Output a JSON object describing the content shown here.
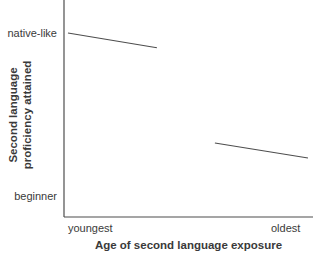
{
  "chart_data": {
    "type": "line",
    "title": "",
    "xlabel": "Age of second language exposure",
    "ylabel": "Second language proficiency attained",
    "x_tick_labels": [
      "youngest",
      "oldest"
    ],
    "y_tick_labels": [
      "native-like",
      "beginner"
    ],
    "x_range": [
      0,
      1
    ],
    "y_range": [
      0,
      1
    ],
    "grid": false,
    "legend": false,
    "line_color": "#4d4d4d",
    "series": [
      {
        "name": "early-exposure-segment",
        "points": [
          [
            0.016,
            1.0
          ],
          [
            0.373,
            0.91
          ]
        ]
      },
      {
        "name": "late-exposure-segment",
        "points": [
          [
            0.606,
            0.325
          ],
          [
            0.98,
            0.233
          ]
        ]
      }
    ]
  },
  "labels": {
    "y_tick_top": "native-like",
    "y_tick_bottom": "beginner",
    "x_tick_left": "youngest",
    "x_tick_right": "oldest",
    "ylabel_line1": "Second language",
    "ylabel_line2": "proficiency attained",
    "xlabel": "Age of second language exposure"
  },
  "colors": {
    "background": "#ffffff",
    "axis": "#4d4d4d",
    "line": "#4d4d4d",
    "text": "#3a3a3a"
  }
}
